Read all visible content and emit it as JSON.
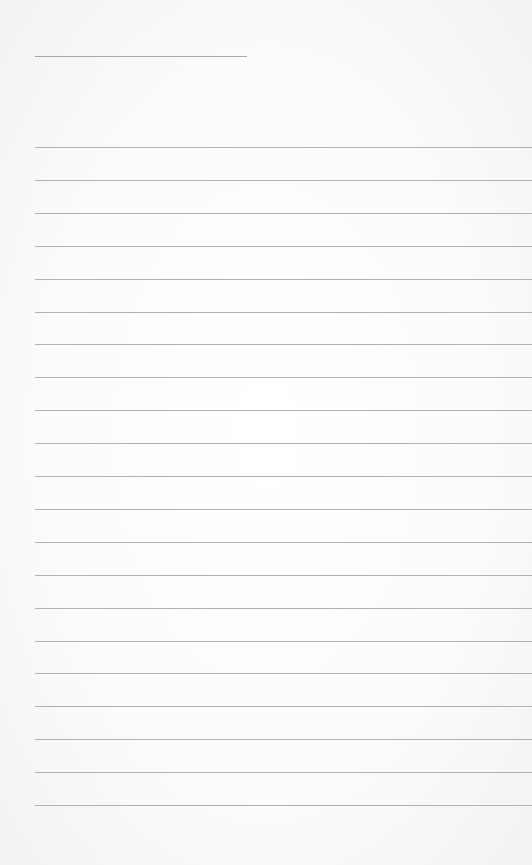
{
  "page": {
    "type": "lined-paper",
    "background_color": "#fafafa",
    "line_color": "#b2b2b2",
    "header_line": {
      "left": 35,
      "top": 56,
      "width": 212
    },
    "rules": {
      "left": 35,
      "first_top": 147,
      "spacing": 32.9,
      "count": 21
    }
  }
}
